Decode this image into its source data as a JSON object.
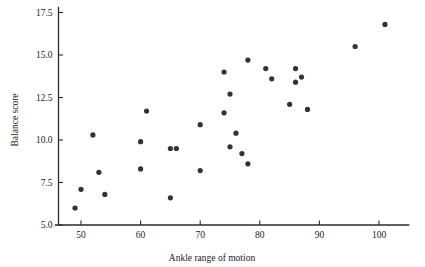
{
  "chart_data": {
    "type": "scatter",
    "title": "",
    "xlabel": "Ankle range of motion",
    "ylabel": "Balance score",
    "xlim": [
      46,
      105
    ],
    "ylim": [
      5.0,
      17.8
    ],
    "xticks": [
      50,
      60,
      70,
      80,
      90,
      100
    ],
    "yticks": [
      "5.0",
      "7.5",
      "10.0",
      "12.5",
      "15.0",
      "17.5"
    ],
    "ytick_values": [
      5.0,
      7.5,
      10.0,
      12.5,
      15.0,
      17.5
    ],
    "grid": false,
    "legend": false,
    "marker": "filled-circle",
    "marker_color": "#33313a",
    "points": [
      {
        "x": 49,
        "y": 6.0
      },
      {
        "x": 50,
        "y": 7.1
      },
      {
        "x": 52,
        "y": 10.3
      },
      {
        "x": 53,
        "y": 8.1
      },
      {
        "x": 54,
        "y": 6.8
      },
      {
        "x": 60,
        "y": 9.9
      },
      {
        "x": 60,
        "y": 8.3
      },
      {
        "x": 61,
        "y": 11.7
      },
      {
        "x": 65,
        "y": 9.5
      },
      {
        "x": 65,
        "y": 6.6
      },
      {
        "x": 66,
        "y": 9.5
      },
      {
        "x": 70,
        "y": 10.9
      },
      {
        "x": 70,
        "y": 8.2
      },
      {
        "x": 74,
        "y": 14.0
      },
      {
        "x": 74,
        "y": 11.6
      },
      {
        "x": 75,
        "y": 12.7
      },
      {
        "x": 75,
        "y": 9.6
      },
      {
        "x": 76,
        "y": 10.4
      },
      {
        "x": 77,
        "y": 9.2
      },
      {
        "x": 78,
        "y": 14.7
      },
      {
        "x": 78,
        "y": 8.6
      },
      {
        "x": 81,
        "y": 14.2
      },
      {
        "x": 82,
        "y": 13.6
      },
      {
        "x": 85,
        "y": 12.1
      },
      {
        "x": 86,
        "y": 14.2
      },
      {
        "x": 86,
        "y": 13.4
      },
      {
        "x": 87,
        "y": 13.7
      },
      {
        "x": 88,
        "y": 11.8
      },
      {
        "x": 96,
        "y": 15.5
      },
      {
        "x": 101,
        "y": 16.8
      }
    ]
  },
  "figure": {
    "background": "#ffffff",
    "axis_color": "#2b2b2b"
  }
}
